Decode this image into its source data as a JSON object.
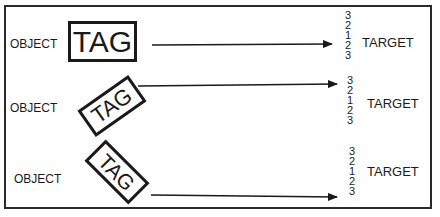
{
  "diagram": {
    "rows": [
      {
        "object_label": "OBJECT",
        "tag_label": "TAG",
        "tag_rotation_deg": 0,
        "target_label": "TARGET",
        "scale": [
          "3",
          "2",
          "1",
          "2",
          "3"
        ]
      },
      {
        "object_label": "OBJECT",
        "tag_label": "TAG",
        "tag_rotation_deg": -35,
        "target_label": "TARGET",
        "scale": [
          "3",
          "2",
          "1",
          "2",
          "3"
        ]
      },
      {
        "object_label": "OBJECT",
        "tag_label": "TAG",
        "tag_rotation_deg": 45,
        "target_label": "TARGET",
        "scale": [
          "3",
          "2",
          "1",
          "2",
          "3"
        ]
      }
    ],
    "colors": {
      "line": "#1a1a1a",
      "frame": "#2a2a2a",
      "background": "#ffffff"
    }
  }
}
